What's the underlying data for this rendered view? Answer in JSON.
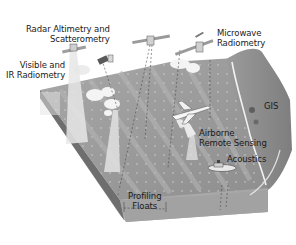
{
  "diagram": {
    "labels": {
      "radar_altimetry": {
        "line1": "Radar Altimetry and",
        "line2": "Scatterometry"
      },
      "visible_ir": {
        "line1": "Visible and",
        "line2": "IR Radiometry"
      },
      "microwave": {
        "line1": "Microwave",
        "line2": "Radiometry"
      },
      "gis": "GIS",
      "airborne": {
        "line1": "Airborne",
        "line2": "Remote Sensing"
      },
      "acoustics": "Acoustics",
      "profiling_floats": {
        "line1": "Profiling",
        "line2": "Floats"
      }
    },
    "colors": {
      "ocean": "#9a9a9a",
      "ocean_light": "#b8b8b8",
      "land": "#8a8a8a",
      "side": "#7a7a7a",
      "beam": "#e6e6e6",
      "cloud": "#f4f4f4",
      "text": "#1a1a1a"
    }
  }
}
